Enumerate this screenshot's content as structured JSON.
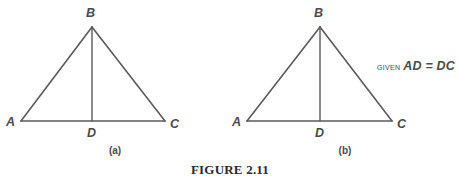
{
  "figure": {
    "caption": "FIGURE 2.11",
    "stroke_color": "#5a5a5a",
    "label_color": "#4a4a4a",
    "background_color": "#ffffff"
  },
  "panels": [
    {
      "id": "a",
      "sub_caption": "(a)",
      "labels": {
        "apex": "B",
        "left": "A",
        "right": "C",
        "foot": "D"
      },
      "geometry": {
        "A": [
          21,
          121
        ],
        "B": [
          92,
          27
        ],
        "C": [
          165,
          121
        ],
        "D": [
          92,
          121
        ]
      }
    },
    {
      "id": "b",
      "sub_caption": "(b)",
      "labels": {
        "apex": "B",
        "left": "A",
        "right": "C",
        "foot": "D"
      },
      "geometry": {
        "A": [
          17,
          121
        ],
        "B": [
          90,
          27
        ],
        "C": [
          162,
          121
        ],
        "D": [
          90,
          121
        ]
      },
      "annotation": {
        "given_word": "GIVEN",
        "equation": "AD = DC"
      }
    }
  ]
}
